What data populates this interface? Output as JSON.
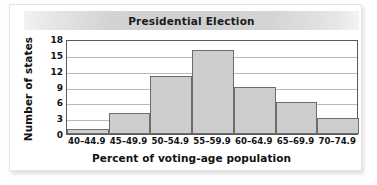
{
  "chart_data": {
    "type": "bar",
    "title": "Presidential Election",
    "xlabel": "Percent of voting-age population",
    "ylabel": "Number of states",
    "categories": [
      "40–44.9",
      "45–49.9",
      "50–54.9",
      "55–59.9",
      "60–64.9",
      "65–69.9",
      "70–74.9"
    ],
    "values": [
      1,
      4,
      11,
      16,
      9,
      6,
      3
    ],
    "ylim": [
      0,
      18
    ],
    "yticks": [
      0,
      3,
      6,
      9,
      12,
      15,
      18
    ],
    "ytick_labels": [
      "0",
      "3",
      "6",
      "9",
      "12",
      "15",
      "18"
    ],
    "grid": true,
    "legend": false,
    "bar_fill_color": "#cdcdcd",
    "bar_edge_color": "#6d6d6d",
    "gridline_color": "#b9b9b9",
    "axis_color": "#5a5a5a",
    "title_band_color": "#cfcfcf"
  }
}
